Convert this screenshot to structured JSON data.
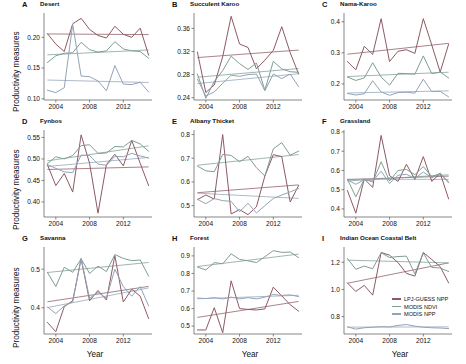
{
  "figure": {
    "ylabel": "Productivity measures",
    "xlabel": "Year",
    "xticks": [
      "2004",
      "2008",
      "2012"
    ],
    "xtick_values": [
      2004,
      2008,
      2012
    ],
    "xlim": [
      2002.6,
      2015.4
    ]
  },
  "legend": {
    "position": "panel-I-lower-right",
    "items": [
      {
        "label": "LPJ-GUESS NPP",
        "color": "#8c5a63"
      },
      {
        "label": "MODIS NDVI",
        "color": "#7f9e94"
      },
      {
        "label": "MODIS NPP",
        "color": "#93a3b8"
      }
    ]
  },
  "chart_data": [
    {
      "type": "line",
      "panel": "A",
      "title": "Desert",
      "xlabel": "Year",
      "ylabel": "Productivity measures",
      "x": [
        2003,
        2004,
        2005,
        2006,
        2007,
        2008,
        2009,
        2010,
        2011,
        2012,
        2013,
        2014,
        2015
      ],
      "ylim": [
        0.098,
        0.238
      ],
      "yticks": [
        0.1,
        0.15,
        0.2
      ],
      "ytick_labels": [
        "0.10",
        "0.15",
        "0.20"
      ],
      "series": [
        {
          "name": "LPJ-GUESS NPP",
          "color": "#8c5a63",
          "values": [
            0.206,
            0.189,
            0.177,
            0.222,
            0.231,
            0.213,
            0.203,
            0.199,
            0.218,
            0.205,
            0.2,
            0.215,
            0.171
          ],
          "trend": [
            0.2055,
            0.2045
          ]
        },
        {
          "name": "MODIS NDVI",
          "color": "#7f9e94",
          "values": [
            0.159,
            0.17,
            0.174,
            0.175,
            0.192,
            0.18,
            0.176,
            0.178,
            0.193,
            0.181,
            0.178,
            0.177,
            0.166
          ],
          "trend": [
            0.1715,
            0.1795
          ]
        },
        {
          "name": "MODIS NPP",
          "color": "#93a3b8",
          "values": [
            0.114,
            0.11,
            0.118,
            0.221,
            0.137,
            0.136,
            0.129,
            0.113,
            0.154,
            0.124,
            0.123,
            0.127,
            0.111
          ],
          "trend": [
            0.1305,
            0.1265
          ]
        }
      ]
    },
    {
      "type": "line",
      "panel": "B",
      "title": "Succulent Karoo",
      "xlabel": "Year",
      "ylabel": "",
      "x": [
        2003,
        2004,
        2005,
        2006,
        2007,
        2008,
        2009,
        2010,
        2011,
        2012,
        2013,
        2014,
        2015
      ],
      "ylim": [
        0.236,
        0.385
      ],
      "yticks": [
        0.24,
        0.28,
        0.32,
        0.36
      ],
      "ytick_labels": [
        "0.24",
        "0.28",
        "0.32",
        "0.36"
      ],
      "series": [
        {
          "name": "LPJ-GUESS NPP",
          "color": "#8c5a63",
          "values": [
            0.319,
            0.249,
            0.262,
            0.311,
            0.381,
            0.333,
            0.327,
            0.29,
            0.305,
            0.322,
            0.363,
            0.318,
            0.281
          ],
          "trend": [
            0.3095,
            0.3225
          ]
        },
        {
          "name": "MODIS NDVI",
          "color": "#7f9e94",
          "values": [
            0.281,
            0.239,
            0.268,
            0.287,
            0.312,
            0.299,
            0.289,
            0.3,
            0.253,
            0.303,
            0.29,
            0.285,
            0.284
          ],
          "trend": [
            0.2755,
            0.2905
          ]
        },
        {
          "name": "MODIS NPP",
          "color": "#93a3b8",
          "values": [
            0.272,
            0.243,
            0.25,
            0.265,
            0.279,
            0.277,
            0.28,
            0.281,
            0.252,
            0.281,
            0.273,
            0.281,
            0.259
          ],
          "trend": [
            0.2645,
            0.2815
          ]
        }
      ]
    },
    {
      "type": "line",
      "panel": "C",
      "title": "Nama-Karoo",
      "xlabel": "Year",
      "ylabel": "",
      "x": [
        2003,
        2004,
        2005,
        2006,
        2007,
        2008,
        2009,
        2010,
        2011,
        2012,
        2013,
        2014,
        2015
      ],
      "ylim": [
        0.148,
        0.425
      ],
      "yticks": [
        0.2,
        0.3,
        0.4
      ],
      "ytick_labels": [
        "0.2",
        "0.3",
        "0.4"
      ],
      "series": [
        {
          "name": "LPJ-GUESS NPP",
          "color": "#8c5a63",
          "values": [
            0.272,
            0.245,
            0.321,
            0.295,
            0.41,
            0.272,
            0.305,
            0.31,
            0.298,
            0.41,
            0.325,
            0.238,
            0.328
          ],
          "trend": [
            0.2955,
            0.3305
          ]
        },
        {
          "name": "MODIS NDVI",
          "color": "#7f9e94",
          "values": [
            0.222,
            0.211,
            0.219,
            0.268,
            0.222,
            0.196,
            0.234,
            0.233,
            0.231,
            0.29,
            0.233,
            0.238,
            0.219
          ],
          "trend": [
            0.2235,
            0.2375
          ]
        },
        {
          "name": "MODIS NPP",
          "color": "#93a3b8",
          "values": [
            0.169,
            0.164,
            0.168,
            0.21,
            0.174,
            0.163,
            0.172,
            0.173,
            0.17,
            0.215,
            0.175,
            0.176,
            0.158
          ],
          "trend": [
            0.1705,
            0.1775
          ]
        }
      ]
    },
    {
      "type": "line",
      "panel": "D",
      "title": "Fynbos",
      "xlabel": "Year",
      "ylabel": "Productivity measures",
      "x": [
        2003,
        2004,
        2005,
        2006,
        2007,
        2008,
        2009,
        2010,
        2011,
        2012,
        2013,
        2014,
        2015
      ],
      "ylim": [
        0.365,
        0.565
      ],
      "yticks": [
        0.4,
        0.45,
        0.5,
        0.55
      ],
      "ytick_labels": [
        "0.40",
        "0.45",
        "0.50",
        "0.55"
      ],
      "series": [
        {
          "name": "LPJ-GUESS NPP",
          "color": "#8c5a63",
          "values": [
            0.487,
            0.438,
            0.466,
            0.423,
            0.556,
            0.49,
            0.374,
            0.487,
            0.511,
            0.484,
            0.543,
            0.49,
            0.438
          ],
          "trend": [
            0.4755,
            0.4815
          ]
        },
        {
          "name": "MODIS NDVI",
          "color": "#7f9e94",
          "values": [
            0.489,
            0.505,
            0.5,
            0.508,
            0.531,
            0.533,
            0.513,
            0.514,
            0.529,
            0.528,
            0.543,
            0.535,
            0.518
          ],
          "trend": [
            0.4955,
            0.5305
          ]
        },
        {
          "name": "MODIS NPP",
          "color": "#93a3b8",
          "values": [
            0.487,
            0.478,
            0.47,
            0.468,
            0.509,
            0.508,
            0.488,
            0.485,
            0.506,
            0.505,
            0.513,
            0.507,
            0.502
          ],
          "trend": [
            0.4825,
            0.5035
          ]
        }
      ]
    },
    {
      "type": "line",
      "panel": "E",
      "title": "Albany Thicket",
      "xlabel": "Year",
      "ylabel": "",
      "x": [
        2003,
        2004,
        2005,
        2006,
        2007,
        2008,
        2009,
        2010,
        2011,
        2012,
        2013,
        2014,
        2015
      ],
      "ylim": [
        0.452,
        0.815
      ],
      "yticks": [
        0.5,
        0.6,
        0.7,
        0.8
      ],
      "ytick_labels": [
        "0.5",
        "0.6",
        "0.7",
        "0.8"
      ],
      "series": [
        {
          "name": "LPJ-GUESS NPP",
          "color": "#8c5a63",
          "values": [
            0.525,
            0.545,
            0.528,
            0.8,
            0.465,
            0.483,
            0.462,
            0.495,
            0.625,
            0.715,
            0.707,
            0.515,
            0.585
          ],
          "trend": [
            0.5545,
            0.5875
          ]
        },
        {
          "name": "MODIS NDVI",
          "color": "#7f9e94",
          "values": [
            0.667,
            0.647,
            0.643,
            0.716,
            0.712,
            0.685,
            0.708,
            0.66,
            0.625,
            0.74,
            0.766,
            0.713,
            0.73
          ],
          "trend": [
            0.6705,
            0.7155
          ]
        },
        {
          "name": "MODIS NPP",
          "color": "#93a3b8",
          "values": [
            0.527,
            0.508,
            0.53,
            0.521,
            0.518,
            0.474,
            0.51,
            0.469,
            0.5,
            0.53,
            0.545,
            0.558,
            0.572
          ],
          "trend": [
            0.5525,
            0.5305
          ]
        }
      ]
    },
    {
      "type": "line",
      "panel": "F",
      "title": "Grassland",
      "xlabel": "Year",
      "ylabel": "",
      "x": [
        2003,
        2004,
        2005,
        2006,
        2007,
        2008,
        2009,
        2010,
        2011,
        2012,
        2013,
        2014,
        2015
      ],
      "ylim": [
        0.358,
        0.805
      ],
      "yticks": [
        0.4,
        0.5,
        0.6,
        0.7,
        0.8
      ],
      "ytick_labels": [
        "0.4",
        "0.5",
        "0.6",
        "0.7",
        "0.8"
      ],
      "series": [
        {
          "name": "LPJ-GUESS NPP",
          "color": "#8c5a63",
          "values": [
            0.496,
            0.378,
            0.556,
            0.512,
            0.782,
            0.573,
            0.543,
            0.632,
            0.553,
            0.672,
            0.543,
            0.585,
            0.452
          ],
          "trend": [
            0.5525,
            0.5705
          ]
        },
        {
          "name": "MODIS NDVI",
          "color": "#7f9e94",
          "values": [
            0.554,
            0.463,
            0.555,
            0.54,
            0.645,
            0.545,
            0.6,
            0.605,
            0.578,
            0.62,
            0.568,
            0.585,
            0.54
          ],
          "trend": [
            0.5455,
            0.5775
          ]
        },
        {
          "name": "MODIS NPP",
          "color": "#93a3b8",
          "values": [
            0.551,
            0.528,
            0.552,
            0.545,
            0.596,
            0.532,
            0.575,
            0.58,
            0.558,
            0.592,
            0.562,
            0.582,
            0.535
          ],
          "trend": [
            0.5545,
            0.5535
          ]
        }
      ]
    },
    {
      "type": "line",
      "panel": "G",
      "title": "Savanna",
      "xlabel": "Year",
      "ylabel": "Productivity measures",
      "x": [
        2003,
        2004,
        2005,
        2006,
        2007,
        2008,
        2009,
        2010,
        2011,
        2012,
        2013,
        2014,
        2015
      ],
      "ylim": [
        0.332,
        0.555
      ],
      "yticks": [
        0.4,
        0.5
      ],
      "ytick_labels": [
        "0.4",
        "0.5"
      ],
      "series": [
        {
          "name": "LPJ-GUESS NPP",
          "color": "#8c5a63",
          "values": [
            0.362,
            0.338,
            0.403,
            0.418,
            0.527,
            0.418,
            0.445,
            0.42,
            0.535,
            0.415,
            0.448,
            0.43,
            0.372
          ],
          "trend": [
            0.4155,
            0.4555
          ]
        },
        {
          "name": "MODIS NDVI",
          "color": "#7f9e94",
          "values": [
            0.492,
            0.455,
            0.505,
            0.492,
            0.527,
            0.489,
            0.508,
            0.494,
            0.538,
            0.528,
            0.522,
            0.524,
            0.482
          ],
          "trend": [
            0.4915,
            0.5175
          ]
        },
        {
          "name": "MODIS NPP",
          "color": "#93a3b8",
          "values": [
            0.402,
            0.385,
            0.405,
            0.415,
            0.528,
            0.425,
            0.44,
            0.425,
            0.5,
            0.455,
            0.43,
            0.455,
            0.405
          ],
          "trend": [
            0.4005,
            0.4515
          ]
        }
      ]
    },
    {
      "type": "line",
      "panel": "H",
      "title": "Forest",
      "xlabel": "Year",
      "ylabel": "",
      "x": [
        2003,
        2004,
        2005,
        2006,
        2007,
        2008,
        2009,
        2010,
        2011,
        2012,
        2013,
        2014,
        2015
      ],
      "ylim": [
        0.455,
        0.945
      ],
      "yticks": [
        0.5,
        0.6,
        0.7,
        0.8,
        0.9
      ],
      "ytick_labels": [
        "0.5",
        "0.6",
        "0.7",
        "0.8",
        "0.9"
      ],
      "series": [
        {
          "name": "LPJ-GUESS NPP",
          "color": "#8c5a63",
          "values": [
            0.478,
            0.478,
            0.605,
            0.462,
            0.758,
            0.6,
            0.595,
            0.592,
            0.598,
            0.722,
            0.672,
            0.622,
            0.585
          ],
          "trend": [
            0.5495,
            0.6405
          ]
        },
        {
          "name": "MODIS NDVI",
          "color": "#7f9e94",
          "values": [
            0.837,
            0.82,
            0.862,
            0.855,
            0.912,
            0.88,
            0.872,
            0.862,
            0.895,
            0.93,
            0.92,
            0.922,
            0.89
          ],
          "trend": [
            0.8395,
            0.9105
          ]
        },
        {
          "name": "MODIS NPP",
          "color": "#93a3b8",
          "values": [
            0.66,
            0.657,
            0.662,
            0.655,
            0.665,
            0.655,
            0.662,
            0.655,
            0.665,
            0.68,
            0.675,
            0.678,
            0.668
          ],
          "trend": [
            0.6555,
            0.6755
          ]
        }
      ]
    },
    {
      "type": "line",
      "panel": "I",
      "title": "Indian Ocean Coastal Belt",
      "xlabel": "Year",
      "ylabel": "",
      "x": [
        2003,
        2004,
        2005,
        2006,
        2007,
        2008,
        2009,
        2010,
        2011,
        2012,
        2013,
        2014,
        2015
      ],
      "ylim": [
        0.672,
        1.305
      ],
      "yticks": [
        0.8,
        1.0,
        1.2
      ],
      "ytick_labels": [
        "0.8",
        "1.0",
        "1.2"
      ],
      "series": [
        {
          "name": "LPJ-GUESS NPP",
          "color": "#8c5a63",
          "values": [
            1.048,
            0.985,
            1.03,
            0.958,
            1.272,
            1.252,
            1.198,
            1.118,
            1.098,
            1.272,
            1.22,
            1.168,
            1.048
          ],
          "trend": [
            1.0455,
            1.1955
          ]
        },
        {
          "name": "MODIS NDVI",
          "color": "#7f9e94",
          "values": [
            1.228,
            1.148,
            1.172,
            1.152,
            1.27,
            1.235,
            1.242,
            1.245,
            1.115,
            1.268,
            1.162,
            1.158,
            1.132
          ],
          "trend": [
            1.2155,
            1.1955
          ]
        },
        {
          "name": "MODIS NPP",
          "color": "#93a3b8",
          "values": [
            0.725,
            0.708,
            0.718,
            0.722,
            0.726,
            0.724,
            0.735,
            0.742,
            0.73,
            0.722,
            0.718,
            0.716,
            0.712
          ],
          "trend": [
            0.7225,
            0.7245
          ]
        }
      ]
    }
  ]
}
